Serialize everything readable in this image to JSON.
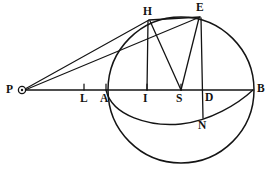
{
  "figure": {
    "type": "geometric-diagram",
    "width": 273,
    "height": 169,
    "background_color": "#ffffff",
    "ink_color": "#141414"
  },
  "labels": {
    "P": "P",
    "L": "L",
    "A": "A",
    "I": "I",
    "S": "S",
    "D": "D",
    "B": "B",
    "H": "H",
    "E": "E",
    "N": "N"
  },
  "points": {
    "P": {
      "x": 22,
      "y": 90,
      "label_x": 6,
      "label_y": 84,
      "marker": "small-open-circle"
    },
    "L": {
      "x": 84,
      "y": 90,
      "label_x": 80,
      "label_y": 93,
      "marker": "tick"
    },
    "A": {
      "x": 106,
      "y": 90,
      "label_x": 101,
      "label_y": 93,
      "marker": "tick"
    },
    "I": {
      "x": 147,
      "y": 90,
      "label_x": 143,
      "label_y": 93,
      "marker": "tick"
    },
    "S": {
      "x": 181,
      "y": 90,
      "label_x": 176,
      "label_y": 93,
      "marker": "tick"
    },
    "D": {
      "x": 203,
      "y": 90,
      "label_x": 205,
      "label_y": 93,
      "marker": "none"
    },
    "B": {
      "x": 253,
      "y": 90,
      "label_x": 257,
      "label_y": 83,
      "marker": "none"
    },
    "H": {
      "x": 149,
      "y": 20,
      "label_x": 143,
      "label_y": 7,
      "marker": "none"
    },
    "E": {
      "x": 200,
      "y": 17,
      "label_x": 196,
      "label_y": 3,
      "marker": "none"
    },
    "N": {
      "x": 203,
      "y": 118,
      "label_x": 198,
      "label_y": 120,
      "marker": "none"
    }
  },
  "shapes": {
    "main_circle": {
      "cx": 181,
      "cy": 90,
      "r": 73,
      "name": "circumscribing-circle"
    },
    "ellipse_arc": {
      "name": "orbit-ellipse-arc",
      "from": "A",
      "to": "B",
      "path": "M 106 90 C 112 116, 150 127, 181 124 C 210 121, 238 104, 253 90"
    }
  },
  "segments": [
    {
      "name": "axis-PB",
      "from": "P",
      "to": "B"
    },
    {
      "name": "ray-PH",
      "from": "P",
      "to": "H"
    },
    {
      "name": "ray-PE",
      "from": "P",
      "to": "E"
    },
    {
      "name": "chord-HE",
      "from": "H",
      "to": "E"
    },
    {
      "name": "perpendicular-HI",
      "from": "H",
      "to": "I"
    },
    {
      "name": "perpendicular-EDN",
      "from": "E",
      "to": "N"
    },
    {
      "name": "radius-HS",
      "from": "H",
      "to": "S"
    },
    {
      "name": "radius-ES",
      "from": "E",
      "to": "S"
    }
  ],
  "ticks": [
    {
      "name": "tick-L",
      "x": 84
    },
    {
      "name": "tick-A",
      "x": 106
    },
    {
      "name": "tick-I",
      "x": 147
    },
    {
      "name": "tick-S",
      "x": 181
    }
  ]
}
